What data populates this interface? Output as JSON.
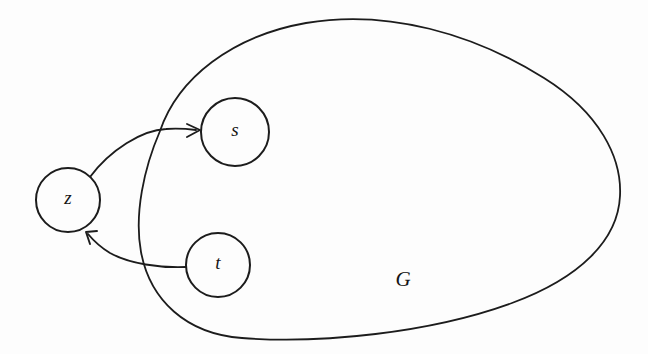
{
  "figure": {
    "background_color": "#fdfdfd",
    "stroke_color": "#1c1c1c",
    "width": 648,
    "height": 354
  },
  "region": {
    "name": "graph-region",
    "label": "G",
    "label_x": 403,
    "label_y": 281,
    "outline_path": "M 160 131 C 178 78 232 36 306 23 C 388 9 474 34 544 78 C 600 113 622 158 620 196 C 618 240 580 278 512 303 C 430 333 320 344 242 338 C 186 334 150 300 141 252 C 134 214 144 168 160 131 Z"
  },
  "nodes": [
    {
      "id": "s",
      "label": "s",
      "cx": 235,
      "cy": 132,
      "r": 34,
      "inside_region": true
    },
    {
      "id": "t",
      "label": "t",
      "cx": 218,
      "cy": 265,
      "r": 32,
      "inside_region": true
    },
    {
      "id": "z",
      "label": "z",
      "cx": 68,
      "cy": 200,
      "r": 32,
      "inside_region": false
    }
  ],
  "edges": [
    {
      "id": "z-to-s",
      "from": "z",
      "to": "s",
      "directed": true,
      "path": "M 90 177 C 110 150 142 130 166 129 C 180 128 188 129 196 130",
      "arrow_tip_x": 200,
      "arrow_tip_y": 130,
      "arrow_path": "M 187 124 L 200 130 L 187 137"
    },
    {
      "id": "t-to-z",
      "from": "t",
      "to": "z",
      "directed": true,
      "path": "M 186 267 C 160 268 130 264 110 253 C 100 247 93 240 88 234",
      "arrow_tip_x": 86,
      "arrow_tip_y": 232,
      "arrow_path": "M 97 231 L 86 232 L 90 244"
    }
  ]
}
